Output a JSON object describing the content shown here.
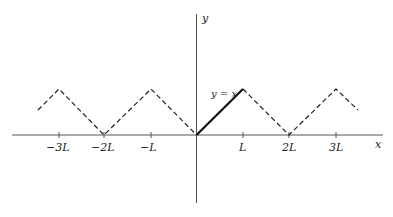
{
  "diagram": {
    "axis_labels": {
      "x": "x",
      "y": "y"
    },
    "tick_labels": [
      "−3L",
      "−2L",
      "−L",
      "L",
      "2L",
      "3L"
    ],
    "curve_label": "y = x",
    "colors": {
      "axis": "#555555",
      "curve": "#111111",
      "dashed": "#222222"
    }
  }
}
